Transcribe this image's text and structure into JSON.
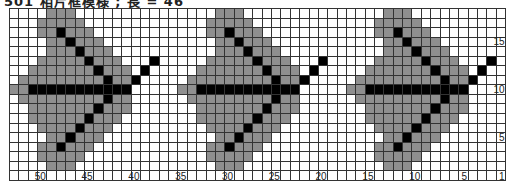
{
  "title": "501 相片框模様 ; 長 = 46",
  "chart": {
    "columns": 53,
    "rows": 18,
    "colors": {
      "empty": "#ffffff",
      "gray": "#8f8f8f",
      "black": "#000000",
      "gridline": "#333333"
    },
    "motif_width": 18,
    "motif_offsets": [
      0,
      18,
      36
    ],
    "motif": [
      "....ggg...........",
      "...ggggg..........",
      "...ggbggg.........",
      "....ggbggg........",
      "....gggbggg.......",
      "...gggggbggg...b..",
      "..gggggggbggg.b...",
      ".gggggggggbggb....",
      "ggbbbbbbbbbbb.....",
      ".gggggggggbgg.....",
      "..gggggggbggg.....",
      "..ggggggbggg......",
      "...ggggbggg.......",
      "....ggbggg........",
      "...ggbggg.........",
      "...ggggg..........",
      "....ggg..........."
    ],
    "column_labels": [
      {
        "label": "50",
        "col": 50
      },
      {
        "label": "45",
        "col": 45
      },
      {
        "label": "40",
        "col": 40
      },
      {
        "label": "35",
        "col": 35
      },
      {
        "label": "30",
        "col": 30
      },
      {
        "label": "25",
        "col": 25
      },
      {
        "label": "20",
        "col": 20
      },
      {
        "label": "15",
        "col": 15
      },
      {
        "label": "10",
        "col": 10
      },
      {
        "label": "5",
        "col": 5
      },
      {
        "label": "1",
        "col": 1
      }
    ],
    "row_labels": [
      {
        "label": "15",
        "row": 15
      },
      {
        "label": "10",
        "row": 10
      },
      {
        "label": "5",
        "row": 5
      }
    ]
  }
}
